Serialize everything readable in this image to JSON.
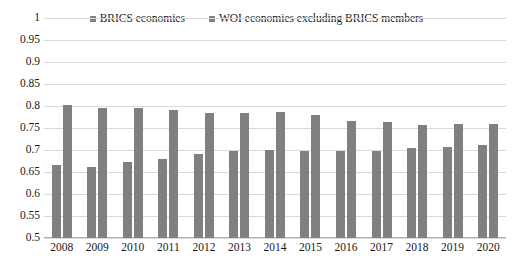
{
  "chart_data": {
    "type": "bar",
    "title": "",
    "subtitle": "",
    "xlabel": "",
    "ylabel": "",
    "ylim": [
      0.5,
      1
    ],
    "ytick_step": 0.05,
    "yticks": [
      "1",
      "0.95",
      "0.9",
      "0.85",
      "0.8",
      "0.75",
      "0.7",
      "0.65",
      "0.6",
      "0.55",
      "0.5"
    ],
    "ytick_values": [
      1,
      0.95,
      0.9,
      0.85,
      0.8,
      0.75,
      0.7,
      0.65,
      0.6,
      0.55,
      0.5
    ],
    "grid": true,
    "legend_position": "top-center",
    "categories": [
      "2008",
      "2009",
      "2010",
      "2011",
      "2012",
      "2013",
      "2014",
      "2015",
      "2016",
      "2017",
      "2018",
      "2019",
      "2020"
    ],
    "series": [
      {
        "name": "BRICS economies",
        "color": "#808080",
        "values": [
          0.665,
          0.662,
          0.672,
          0.679,
          0.69,
          0.697,
          0.7,
          0.697,
          0.697,
          0.698,
          0.705,
          0.707,
          0.712
        ]
      },
      {
        "name": "WOI economies excluding BRICS members",
        "color": "#808080",
        "values": [
          0.803,
          0.796,
          0.795,
          0.79,
          0.785,
          0.784,
          0.786,
          0.779,
          0.765,
          0.763,
          0.757,
          0.76,
          0.758
        ]
      }
    ]
  },
  "legend": {
    "items": [
      {
        "label": "BRICS economies",
        "swatch": "legend-swatch-square"
      },
      {
        "label": "WOI economies excluding BRICS members",
        "swatch": "legend-swatch-square"
      }
    ]
  }
}
